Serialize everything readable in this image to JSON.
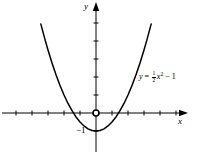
{
  "figure": {
    "name": "parabola-graph",
    "background_color": "#ffffff",
    "stroke_color": "#000000"
  },
  "axes": {
    "x_label": "x",
    "y_label": "y",
    "origin_px": {
      "x": 96,
      "y": 113
    },
    "unit_px": {
      "x": 16,
      "y": 18
    },
    "x_range": [
      -5.9,
      6.3
    ],
    "y_range": [
      -2.3,
      6.2
    ],
    "x_ticks": [
      -5,
      -4,
      -3,
      -2,
      -1,
      1,
      2,
      3,
      4,
      5
    ],
    "y_ticks": [
      1,
      2,
      3,
      4,
      5
    ],
    "tick_length_px": 4,
    "arrowheads": [
      "x-positive",
      "y-positive"
    ],
    "grid": false
  },
  "labels": {
    "y_intercept": "−1",
    "equation_plain": "y = ½x² − 1",
    "equation_parts": {
      "lhs": "y",
      "equals": "=",
      "numerator": "1",
      "denominator": "2",
      "variable": "x",
      "exponent": "2",
      "minus": "−",
      "constant": "1"
    }
  },
  "markers": {
    "origin_dot": {
      "label": "origin",
      "radius_px": 3
    }
  },
  "chart_data": {
    "type": "line",
    "title": "",
    "xlabel": "x",
    "ylabel": "y",
    "legend": [],
    "grid": false,
    "xlim": [
      -5.9,
      6.3
    ],
    "ylim": [
      -2.3,
      6.2
    ],
    "xticks": [
      -5,
      -4,
      -3,
      -2,
      -1,
      1,
      2,
      3,
      4,
      5
    ],
    "yticks": [
      1,
      2,
      3,
      4,
      5
    ],
    "annotations": [
      {
        "text": "−1",
        "x": 0,
        "y": -1,
        "role": "vertex-y-value"
      },
      {
        "text": "y = 1/2 x^2 − 1",
        "x": 3.6,
        "y": 2.3,
        "role": "curve-equation"
      }
    ],
    "series": [
      {
        "name": "y = 1/2 x^2 - 1",
        "equation": "y = 0.5*x^2 - 1",
        "vertex": [
          0,
          -1
        ],
        "x_intercepts": [
          -1.414,
          1.414
        ],
        "y_intercept": -1,
        "x": [
          -3.45,
          -3.2,
          -3.0,
          -2.75,
          -2.5,
          -2.25,
          -2.0,
          -1.75,
          -1.5,
          -1.25,
          -1.0,
          -0.75,
          -0.5,
          -0.25,
          0,
          0.25,
          0.5,
          0.75,
          1.0,
          1.25,
          1.5,
          1.75,
          2.0,
          2.25,
          2.5,
          2.75,
          3.0,
          3.2,
          3.45
        ],
        "values": [
          4.95,
          4.12,
          3.5,
          2.78,
          2.13,
          1.53,
          1.0,
          0.53,
          0.13,
          -0.22,
          -0.5,
          -0.72,
          -0.88,
          -0.97,
          -1.0,
          -0.97,
          -0.88,
          -0.72,
          -0.5,
          -0.22,
          0.13,
          0.53,
          1.0,
          1.53,
          2.13,
          2.78,
          3.5,
          4.12,
          4.95
        ]
      }
    ]
  }
}
